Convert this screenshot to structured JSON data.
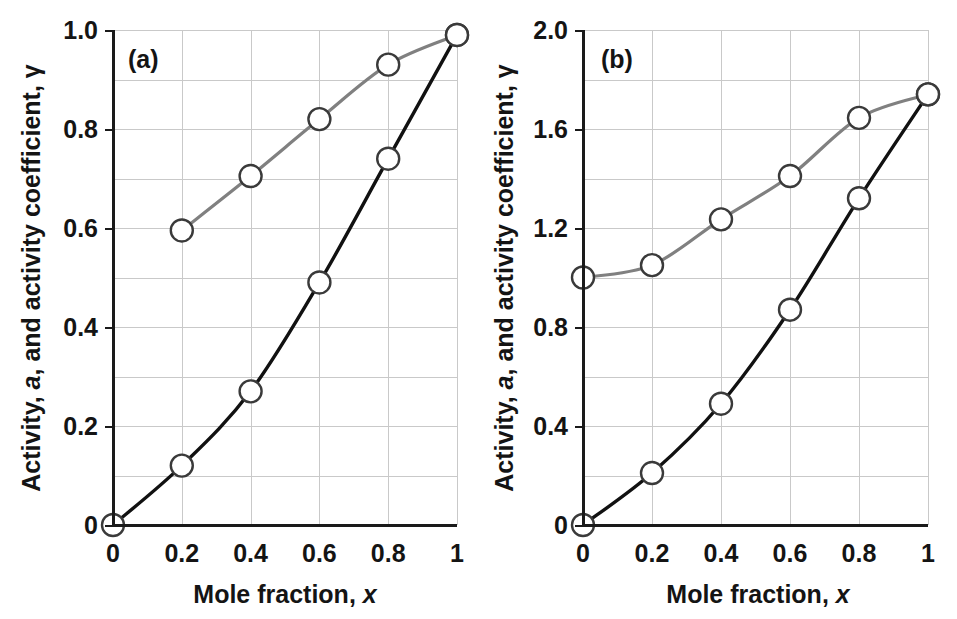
{
  "figure": {
    "width": 957,
    "height": 619,
    "background": "#ffffff",
    "panel_count": 2
  },
  "colors": {
    "activity_curve": "#111111",
    "gamma_curve": "#808080",
    "marker_fill": "#ffffff",
    "marker_stroke": "#3a3a3a",
    "gridline": "#c9c9c9",
    "axis": "#1a1a1a",
    "text": "#141414"
  },
  "chart_data": [
    {
      "type": "line",
      "panel_label": "(a)",
      "title": "",
      "xlabel_parts": {
        "main": "Mole fraction,",
        "symbol": "x"
      },
      "ylabel_parts": {
        "prefix": "Activity,",
        "symbol_a": "a",
        "middle": ", and activity coefficient,",
        "symbol_gamma": "γ"
      },
      "xlabel": "Mole fraction, x",
      "ylabel": "Activity, a, and activity coefficient, γ",
      "xlim": [
        0,
        1
      ],
      "ylim": [
        0,
        1.0
      ],
      "xticks": [
        0,
        0.2,
        0.4,
        0.6,
        0.8,
        1
      ],
      "xtick_labels": [
        "0",
        "0.2",
        "0.4",
        "0.6",
        "0.8",
        "1"
      ],
      "yticks": [
        0,
        0.2,
        0.4,
        0.6,
        0.8,
        1.0
      ],
      "ytick_labels": [
        "0",
        "0.2",
        "0.4",
        "0.6",
        "0.8",
        "1.0"
      ],
      "grid": true,
      "grid_x_step": 0.2,
      "grid_y_step": 0.1,
      "legend": "none",
      "series": [
        {
          "name": "activity, a",
          "color": "#111111",
          "marker": "open-circle",
          "x": [
            0,
            0.2,
            0.4,
            0.6,
            0.8,
            1.0
          ],
          "values": [
            0.0,
            0.12,
            0.27,
            0.49,
            0.74,
            0.99
          ]
        },
        {
          "name": "activity coefficient, γ",
          "color": "#808080",
          "marker": "open-circle",
          "x": [
            0.2,
            0.4,
            0.6,
            0.8,
            1.0
          ],
          "values": [
            0.595,
            0.705,
            0.82,
            0.93,
            0.99
          ]
        }
      ]
    },
    {
      "type": "line",
      "panel_label": "(b)",
      "title": "",
      "xlabel_parts": {
        "main": "Mole fraction,",
        "symbol": "x"
      },
      "ylabel_parts": {
        "prefix": "Activity,",
        "symbol_a": "a",
        "middle": ", and activity coefficient,",
        "symbol_gamma": "γ"
      },
      "xlabel": "Mole fraction, x",
      "ylabel": "Activity, a, and activity coefficient, γ",
      "xlim": [
        0,
        1
      ],
      "ylim": [
        0,
        2.0
      ],
      "xticks": [
        0,
        0.2,
        0.4,
        0.6,
        0.8,
        1
      ],
      "xtick_labels": [
        "0",
        "0.2",
        "0.4",
        "0.6",
        "0.8",
        "1"
      ],
      "yticks": [
        0,
        0.4,
        0.8,
        1.2,
        1.6,
        2.0
      ],
      "ytick_labels": [
        "0",
        "0.4",
        "0.8",
        "1.2",
        "1.6",
        "2.0"
      ],
      "grid": true,
      "grid_x_step": 0.2,
      "grid_y_step": 0.2,
      "legend": "none",
      "series": [
        {
          "name": "activity, a",
          "color": "#111111",
          "marker": "open-circle",
          "x": [
            0,
            0.2,
            0.4,
            0.6,
            0.8,
            1.0
          ],
          "values": [
            0.0,
            0.21,
            0.49,
            0.87,
            1.32,
            1.74
          ]
        },
        {
          "name": "activity coefficient, γ",
          "color": "#808080",
          "marker": "open-circle",
          "x": [
            0,
            0.2,
            0.4,
            0.6,
            0.8,
            1.0
          ],
          "values": [
            1.0,
            1.05,
            1.235,
            1.41,
            1.645,
            1.74
          ]
        }
      ]
    }
  ]
}
